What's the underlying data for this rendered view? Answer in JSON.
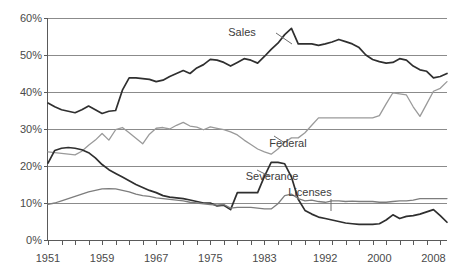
{
  "chart_data": {
    "type": "line",
    "title": "",
    "subtitle": "",
    "xlabel": "",
    "ylabel": "",
    "grid": true,
    "legend_position": "inline-annotations",
    "xlim": [
      1951,
      2010
    ],
    "ylim": [
      0,
      60
    ],
    "y_ticks": [
      0,
      10,
      20,
      30,
      40,
      50,
      60
    ],
    "y_tick_labels": [
      "0%",
      "10%",
      "20%",
      "30%",
      "40%",
      "50%",
      "60%"
    ],
    "x_tick_labels": [
      "1951",
      "1959",
      "1967",
      "1975",
      "1983",
      "1992",
      "2000",
      "2008"
    ],
    "x_tick_values": [
      1951,
      1959,
      1967,
      1975,
      1983,
      1992,
      2000,
      2008
    ],
    "x_minor_tick_step": 2,
    "x": [
      1951,
      1952,
      1953,
      1954,
      1955,
      1956,
      1957,
      1958,
      1959,
      1960,
      1961,
      1962,
      1963,
      1964,
      1965,
      1966,
      1967,
      1968,
      1969,
      1970,
      1971,
      1972,
      1973,
      1974,
      1975,
      1976,
      1977,
      1978,
      1979,
      1980,
      1981,
      1982,
      1983,
      1984,
      1985,
      1986,
      1987,
      1988,
      1989,
      1990,
      1991,
      1992,
      1993,
      1994,
      1995,
      1996,
      1997,
      1998,
      1999,
      2000,
      2001,
      2002,
      2003,
      2004,
      2005,
      2006,
      2007,
      2008,
      2009,
      2010
    ],
    "series": [
      {
        "name": "Sales",
        "color": "#2f2f2f",
        "width": 1.7,
        "values": [
          37.0,
          36.0,
          35.2,
          34.8,
          34.4,
          35.2,
          36.2,
          35.2,
          34.2,
          34.8,
          35.0,
          40.5,
          43.8,
          43.8,
          43.6,
          43.4,
          42.8,
          43.2,
          44.2,
          45.0,
          45.8,
          45.0,
          46.5,
          47.4,
          48.8,
          48.6,
          48.0,
          47.0,
          48.0,
          49.0,
          48.6,
          47.8,
          49.6,
          51.5,
          53.2,
          55.5,
          57.2,
          53.0,
          53.0,
          53.0,
          52.6,
          53.0,
          53.5,
          54.2,
          53.6,
          53.0,
          52.0,
          50.0,
          48.8,
          48.2,
          47.8,
          48.0,
          49.0,
          48.6,
          47.0,
          46.0,
          45.6,
          43.8,
          44.2,
          45.0
        ]
      },
      {
        "name": "Federal",
        "color": "#9a9a9a",
        "width": 1.3,
        "values": [
          23.8,
          23.6,
          23.4,
          23.2,
          23.0,
          24.0,
          25.6,
          27.0,
          28.8,
          27.0,
          29.8,
          30.4,
          29.0,
          27.5,
          26.0,
          28.6,
          30.2,
          30.4,
          30.0,
          31.0,
          31.8,
          30.8,
          30.5,
          29.8,
          30.6,
          30.2,
          29.8,
          29.2,
          28.4,
          27.0,
          25.8,
          24.6,
          23.8,
          23.2,
          24.6,
          26.4,
          27.6,
          27.6,
          29.0,
          31.0,
          33.0,
          33.0,
          33.0,
          33.0,
          33.0,
          33.0,
          33.0,
          33.0,
          33.0,
          33.6,
          36.8,
          39.8,
          39.5,
          39.2,
          36.0,
          33.4,
          36.8,
          40.2,
          41.0,
          42.8
        ]
      },
      {
        "name": "Severance",
        "color": "#2f2f2f",
        "width": 1.7,
        "values": [
          20.8,
          24.2,
          24.8,
          25.0,
          24.8,
          24.4,
          23.6,
          22.2,
          20.4,
          19.0,
          18.0,
          17.0,
          16.0,
          15.0,
          14.2,
          13.4,
          12.8,
          12.0,
          11.6,
          11.4,
          11.2,
          10.8,
          10.4,
          10.0,
          10.0,
          9.2,
          9.4,
          8.2,
          12.8,
          12.8,
          12.8,
          12.8,
          17.2,
          21.0,
          21.0,
          20.6,
          17.0,
          11.0,
          8.0,
          7.0,
          6.2,
          5.8,
          5.4,
          5.0,
          4.6,
          4.4,
          4.2,
          4.2,
          4.2,
          4.4,
          5.4,
          6.8,
          5.8,
          6.4,
          6.6,
          7.0,
          7.6,
          8.2,
          6.6,
          4.8
        ]
      },
      {
        "name": "Licenses",
        "color": "#7d7d7d",
        "width": 1.3,
        "values": [
          9.6,
          10.0,
          10.6,
          11.2,
          11.8,
          12.4,
          13.0,
          13.4,
          13.8,
          13.9,
          13.8,
          13.4,
          13.0,
          12.4,
          12.0,
          11.8,
          11.4,
          11.2,
          11.0,
          10.8,
          10.6,
          10.2,
          10.0,
          9.8,
          9.6,
          9.4,
          9.6,
          8.6,
          8.8,
          8.8,
          8.8,
          8.6,
          8.4,
          8.4,
          9.8,
          12.0,
          12.4,
          11.2,
          10.6,
          10.8,
          10.4,
          10.2,
          10.6,
          10.6,
          10.4,
          10.5,
          10.4,
          10.4,
          10.4,
          10.2,
          10.2,
          10.4,
          10.6,
          10.6,
          10.8,
          11.2,
          11.2,
          11.2,
          11.2,
          11.2
        ]
      }
    ],
    "annotations": [
      {
        "label": "Sales",
        "x_px": 242,
        "y_px": 36,
        "leader": {
          "x1": 276,
          "y1": 33,
          "x2": 292,
          "y2": 44
        }
      },
      {
        "label": "Federal",
        "x_px": 288,
        "y_px": 147,
        "leader": {
          "x1": 285,
          "y1": 143,
          "x2": 274,
          "y2": 136
        }
      },
      {
        "label": "Severance",
        "x_px": 272,
        "y_px": 180,
        "leader": {
          "x1": 269,
          "y1": 176,
          "x2": 257,
          "y2": 170
        }
      },
      {
        "label": "Licenses",
        "x_px": 310,
        "y_px": 196,
        "leader": {
          "x1": 331,
          "y1": 199,
          "x2": 331,
          "y2": 211
        }
      }
    ]
  },
  "axes": {
    "y_axis_name": "percent-of-state-revenue",
    "x_axis_name": "year"
  }
}
